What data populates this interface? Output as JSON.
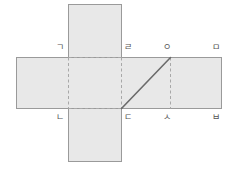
{
  "figure": {
    "type": "geometry-net-diagram",
    "canvas": {
      "width": 237,
      "height": 180
    },
    "colors": {
      "face_fill": "#e8e8e8",
      "solid_edge": "#9a9a9a",
      "dashed_edge": "#a8a8a8",
      "diagonal": "#6b6b6b",
      "label_text": "#555555",
      "background": "#ffffff"
    },
    "faces": [
      {
        "name": "top-flap",
        "x": 68,
        "y": 4,
        "width": 53,
        "height": 53
      },
      {
        "name": "horizontal-band",
        "x": 16,
        "y": 57,
        "width": 206,
        "height": 52
      },
      {
        "name": "bottom-flap",
        "x": 68,
        "y": 109,
        "width": 53,
        "height": 53
      }
    ],
    "dashed_edges": [
      {
        "name": "fold-top",
        "x1": 68,
        "y1": 57,
        "x2": 121,
        "y2": 57
      },
      {
        "name": "fold-bottom",
        "x1": 68,
        "y1": 109,
        "x2": 121,
        "y2": 109
      },
      {
        "name": "fold-left-vertical",
        "x1": 68,
        "y1": 57,
        "x2": 68,
        "y2": 109
      },
      {
        "name": "fold-middle-vertical",
        "x1": 121,
        "y1": 57,
        "x2": 121,
        "y2": 109
      },
      {
        "name": "fold-right-vertical",
        "x1": 170,
        "y1": 57,
        "x2": 170,
        "y2": 109
      }
    ],
    "diagonal": {
      "name": "diagonal-segment",
      "from_label": "ㄷ",
      "to_label": "ㅇ",
      "x1": 121,
      "y1": 109,
      "x2": 170,
      "y2": 57
    },
    "labels": [
      {
        "id": "label-giyeok",
        "text": "ㄱ",
        "x": 56,
        "y": 43
      },
      {
        "id": "label-rieul",
        "text": "ㄹ",
        "x": 124,
        "y": 43
      },
      {
        "id": "label-ieung",
        "text": "ㅇ",
        "x": 163,
        "y": 43
      },
      {
        "id": "label-mieum",
        "text": "ㅁ",
        "x": 212,
        "y": 43
      },
      {
        "id": "label-nieun",
        "text": "ㄴ",
        "x": 56,
        "y": 113
      },
      {
        "id": "label-digeut",
        "text": "ㄷ",
        "x": 124,
        "y": 113
      },
      {
        "id": "label-siot",
        "text": "ㅅ",
        "x": 163,
        "y": 113
      },
      {
        "id": "label-bieup",
        "text": "ㅂ",
        "x": 212,
        "y": 113
      }
    ]
  }
}
